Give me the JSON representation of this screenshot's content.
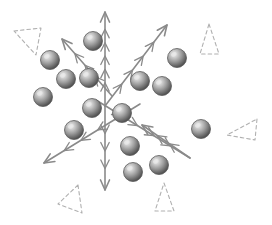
{
  "figure": {
    "title": "Particle cluster with crossed feathered axes",
    "width": 272,
    "height": 225,
    "background_color": "#ffffff",
    "axis_color": "#8a8a8a",
    "axis_stroke_width": 1.6,
    "barb_stroke_width": 1.3,
    "dashed_color": "#b0b0b0",
    "dashed_stroke_width": 1.1,
    "sphere_highlight_color": "#e8e8e8",
    "sphere_mid_color": "#9a9a9a",
    "sphere_dark_color": "#4a4a4a",
    "sphere_outline_color": "#5a5a5a"
  },
  "chart_data": {
    "type": "scatter",
    "title": "Particle cluster with crossed feathered axes",
    "xlabel": "",
    "ylabel": "",
    "xlim": [
      0,
      272
    ],
    "ylim": [
      0,
      225
    ],
    "grid": false,
    "legend": "none",
    "series": [
      {
        "name": "spheres",
        "marker": "sphere",
        "radius": 9.5,
        "points": [
          {
            "id": "s1",
            "x": 93,
            "y": 41
          },
          {
            "id": "s2",
            "x": 50,
            "y": 60
          },
          {
            "id": "s3",
            "x": 66,
            "y": 79
          },
          {
            "id": "s4",
            "x": 89,
            "y": 78
          },
          {
            "id": "s5",
            "x": 43,
            "y": 97
          },
          {
            "id": "s6",
            "x": 92,
            "y": 108
          },
          {
            "id": "s7",
            "x": 122,
            "y": 113
          },
          {
            "id": "s8",
            "x": 74,
            "y": 130
          },
          {
            "id": "s9",
            "x": 140,
            "y": 81
          },
          {
            "id": "s10",
            "x": 162,
            "y": 86
          },
          {
            "id": "s11",
            "x": 177,
            "y": 58
          },
          {
            "id": "s12",
            "x": 130,
            "y": 146
          },
          {
            "id": "s13",
            "x": 133,
            "y": 172
          },
          {
            "id": "s14",
            "x": 159,
            "y": 165
          },
          {
            "id": "s15",
            "x": 201,
            "y": 129
          }
        ]
      },
      {
        "name": "axes",
        "marker": "feathered-arrow",
        "arrows": [
          {
            "id": "a-up",
            "label": "vertical-up-axis",
            "x1": 105,
            "y1": 106,
            "x2": 105,
            "y2": 12,
            "head": "end",
            "barbs": 5
          },
          {
            "id": "a-down",
            "label": "vertical-down-axis",
            "x1": 105,
            "y1": 106,
            "x2": 105,
            "y2": 190,
            "head": "end",
            "barbs": 3
          },
          {
            "id": "a-ne",
            "label": "upper-right-axis",
            "x1": 105,
            "y1": 106,
            "x2": 167,
            "y2": 25,
            "head": "end",
            "barbs": 4
          },
          {
            "id": "a-nw",
            "label": "upper-left-axis",
            "x1": 112,
            "y1": 96,
            "x2": 62,
            "y2": 39,
            "head": "end",
            "barbs": 3
          },
          {
            "id": "a-sw",
            "label": "lower-left-axis",
            "x1": 140,
            "y1": 104,
            "x2": 44,
            "y2": 163,
            "head": "end",
            "barbs": 4
          },
          {
            "id": "a-se",
            "label": "lower-right-axis",
            "x1": 96,
            "y1": 100,
            "x2": 190,
            "y2": 158,
            "head": "none",
            "barbs": 4
          },
          {
            "id": "a-se-back",
            "label": "lower-right-barb-axis",
            "x1": 190,
            "y1": 158,
            "x2": 142,
            "y2": 125,
            "head": "end",
            "barbs": 2
          }
        ]
      },
      {
        "name": "dashed-markers",
        "marker": "dashed-triangle",
        "triangles": [
          {
            "id": "d1",
            "label": "top-left-dashed-arrow",
            "points": "14,31 41,28 36,55"
          },
          {
            "id": "d2",
            "label": "top-right-dashed-triangle",
            "points": "209,24 219,54 200,54"
          },
          {
            "id": "d3",
            "label": "right-dashed-triangle",
            "points": "257,119 255,140 227,135"
          },
          {
            "id": "d4",
            "label": "bottom-left-dashed-arrow",
            "points": "78,185 82,213 58,204"
          },
          {
            "id": "d5",
            "label": "bottom-dashed-triangle",
            "points": "164,183 174,211 155,211"
          }
        ]
      }
    ]
  }
}
